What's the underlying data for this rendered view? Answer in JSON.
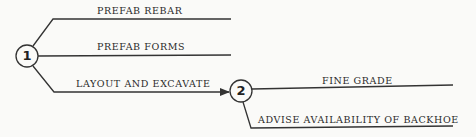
{
  "diagram": {
    "type": "network-flow",
    "colors": {
      "line": "#333333",
      "background": "#fafaf8",
      "text": "#2a2a2a"
    },
    "nodes": [
      {
        "id": "1",
        "label": "1"
      },
      {
        "id": "2",
        "label": "2"
      }
    ],
    "activities": [
      {
        "from": "1",
        "label": "PREFAB REBAR"
      },
      {
        "from": "1",
        "label": "PREFAB FORMS"
      },
      {
        "from": "1",
        "to": "2",
        "label": "LAYOUT AND EXCAVATE"
      },
      {
        "from": "2",
        "label": "FINE GRADE"
      },
      {
        "from": "2",
        "label": "ADVISE AVAILABILITY OF BACKHOE"
      }
    ]
  }
}
